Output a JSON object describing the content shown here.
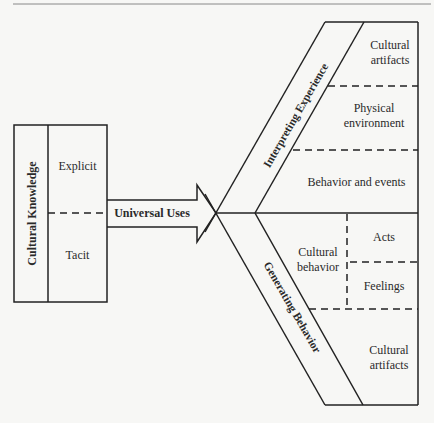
{
  "diagram": {
    "colors": {
      "background": "#f7f7f5",
      "line": "#222222"
    },
    "left_box": {
      "title": "Cultural Knowledge",
      "parts": [
        {
          "label": "Explicit"
        },
        {
          "label": "Tacit"
        }
      ]
    },
    "arrow": {
      "label": "Universal Uses"
    },
    "upper_branch": {
      "title": "Interpreting Experience",
      "items": [
        {
          "label_line1": "Cultural",
          "label_line2": "artifacts"
        },
        {
          "label_line1": "Physical",
          "label_line2": "environment"
        },
        {
          "label_line1": "Behavior and events"
        }
      ]
    },
    "lower_branch": {
      "title": "Generating Behavior",
      "cultural_behavior": {
        "label_line1": "Cultural",
        "label_line2": "behavior",
        "items": [
          {
            "label": "Acts"
          },
          {
            "label": "Feelings"
          }
        ]
      },
      "cultural_artifacts": {
        "label_line1": "Cultural",
        "label_line2": "artifacts"
      }
    }
  }
}
